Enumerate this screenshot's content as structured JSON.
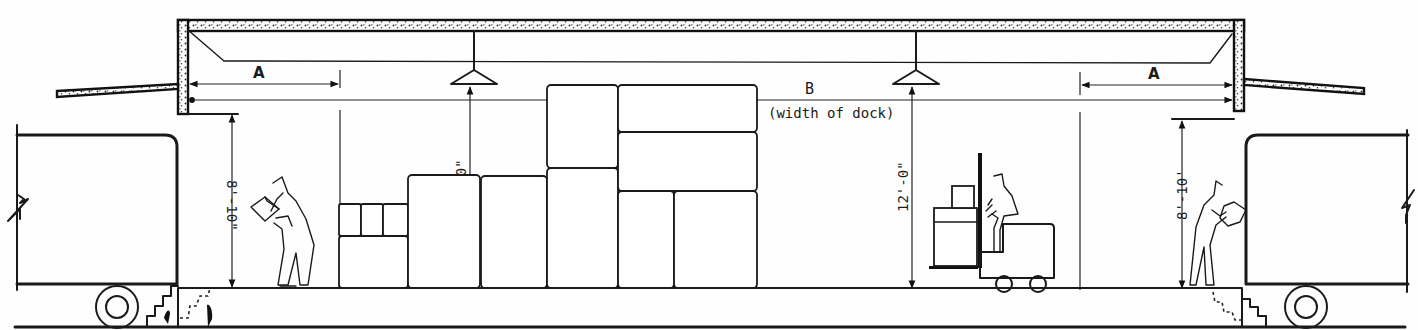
{
  "diagram": {
    "labels": {
      "dim_a_left": "A",
      "dim_a_right": "A",
      "dim_b": "B",
      "dim_b_note": "(width of dock)",
      "height_left_truck": "8'-10\"",
      "height_right_truck": "8'-10'",
      "clear_height_left": "12'-0\"",
      "clear_height_right": "12'-0\""
    },
    "elements": [
      "canopy-roof",
      "left-overhead-door",
      "right-overhead-door",
      "pendant-light-left",
      "pendant-light-right",
      "left-truck",
      "right-truck",
      "stacked-cartons",
      "worker-left",
      "worker-right",
      "forklift-with-operator",
      "dock-platform",
      "steps-left",
      "steps-right"
    ]
  }
}
